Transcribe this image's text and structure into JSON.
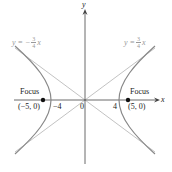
{
  "diagram": {
    "axes": {
      "x_label": "x",
      "y_label": "y",
      "origin_label": "0"
    },
    "ticks": {
      "left_vertex": "−4",
      "right_vertex": "4"
    },
    "foci": [
      {
        "label": "Focus",
        "coords": "(−5, 0)"
      },
      {
        "label": "Focus",
        "coords": "(5, 0)"
      }
    ],
    "asymptotes": {
      "left": {
        "lhs": "y = −",
        "num": "3",
        "den": "4",
        "var": "x"
      },
      "right": {
        "lhs": "y = ",
        "num": "3",
        "den": "4",
        "var": "x"
      }
    },
    "colors": {
      "curve": "#888888",
      "asymptote": "#bbbbbb",
      "axis": "#444444",
      "focus": "#111111"
    }
  }
}
